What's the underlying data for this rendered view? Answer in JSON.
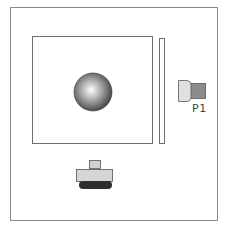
{
  "diagram": {
    "colors": {
      "frame": "#8a8a8a",
      "ball_light": "#ffffff",
      "ball_dark": "#3a3a3a",
      "connector_body": "#e0e0e0",
      "connector_pin": "#8c8c8c",
      "button_cap": "#d6d6d6",
      "button_base": "#2e2e2e"
    },
    "components": {
      "connector": {
        "label": "P1"
      },
      "ball": {
        "name": "sphere"
      },
      "plate": {
        "name": "square-plate"
      },
      "bar": {
        "name": "vertical-bar"
      },
      "button": {
        "name": "push-button"
      }
    }
  }
}
